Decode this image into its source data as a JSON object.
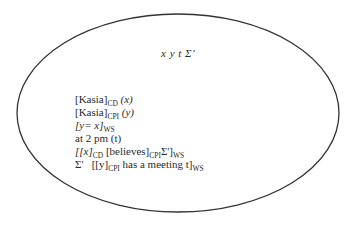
{
  "diagram": {
    "header": "x y t Σ'",
    "header_parts": [
      "x",
      "y",
      "t",
      "Σ'"
    ],
    "lines": [
      {
        "id": "kasia-cd",
        "text": "[Kasia]",
        "sub": "CD",
        "tail": " (x)"
      },
      {
        "id": "kasia-cpi",
        "text": "[Kasia]",
        "sub": "CPI",
        "tail": " (y)"
      },
      {
        "id": "y-equals-x",
        "text": "[y= x]",
        "sub": "WS"
      },
      {
        "id": "at-2pm",
        "text": "at 2 pm (t)"
      },
      {
        "id": "x-believes",
        "parts": [
          "[[x]",
          "CD",
          " [believes]",
          "CPI",
          "Σ']",
          "WS"
        ]
      },
      {
        "id": "sigma-meeting",
        "parts": [
          "Σ'   [[y]",
          "CPI",
          " has a meeting t]",
          "WS"
        ]
      }
    ],
    "ellipse": {
      "cx": 178,
      "cy": 113,
      "rx": 161,
      "ry": 99,
      "stroke": "#333333"
    }
  }
}
